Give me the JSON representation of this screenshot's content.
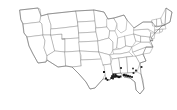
{
  "figure": {
    "kind": "choropleth-point-map",
    "region": "United States (contiguous 48 states)",
    "title": "",
    "subtitle": "",
    "background_color": "#ffffff",
    "state_fill_color": "#ffffff",
    "state_border_color": "#8a8a8a",
    "outline_color": "#6e6e6e",
    "marker_color": "#1a1a1a",
    "legend": "",
    "annotations": []
  },
  "chart_data": {
    "type": "scatter",
    "title": "",
    "xlabel": "",
    "ylabel": "",
    "projection": "albers-usa",
    "xlim": [
      0,
      177
    ],
    "ylim": [
      0,
      110
    ],
    "grid": false,
    "legend_position": "none",
    "marker_shape": "square",
    "marker_color": "#1a1a1a",
    "series": [
      {
        "name": "Observation sites",
        "point_count": 23,
        "points": [
          {
            "x": 104.0,
            "y": 72.0,
            "size": 2.0,
            "region": "Arkansas-Louisiana border"
          },
          {
            "x": 106.0,
            "y": 78.5,
            "size": 2.0,
            "region": "Louisiana west"
          },
          {
            "x": 107.5,
            "y": 80.0,
            "size": 1.8,
            "region": "Louisiana southwest coast"
          },
          {
            "x": 112.5,
            "y": 76.5,
            "size": 2.6,
            "region": "Louisiana central"
          },
          {
            "x": 114.5,
            "y": 76.5,
            "size": 2.6,
            "region": "Louisiana east"
          },
          {
            "x": 116.0,
            "y": 76.0,
            "size": 2.4,
            "region": "Mississippi southwest"
          },
          {
            "x": 117.5,
            "y": 76.5,
            "size": 2.2,
            "region": "Mississippi south"
          },
          {
            "x": 119.0,
            "y": 77.0,
            "size": 2.2,
            "region": "Mississippi gulf"
          },
          {
            "x": 120.5,
            "y": 76.5,
            "size": 2.0,
            "region": "Mississippi coast"
          },
          {
            "x": 113.5,
            "y": 74.5,
            "size": 2.0,
            "region": "Louisiana north"
          },
          {
            "x": 115.5,
            "y": 74.5,
            "size": 1.8,
            "region": "Mississippi interior"
          },
          {
            "x": 111.5,
            "y": 78.0,
            "size": 2.0,
            "region": "Louisiana delta"
          },
          {
            "x": 113.0,
            "y": 78.5,
            "size": 1.8,
            "region": "Louisiana southeast"
          },
          {
            "x": 124.0,
            "y": 75.0,
            "size": 2.2,
            "region": "Alabama south"
          },
          {
            "x": 126.0,
            "y": 75.5,
            "size": 2.4,
            "region": "Alabama gulf"
          },
          {
            "x": 128.0,
            "y": 76.0,
            "size": 2.2,
            "region": "Alabama-Florida line"
          },
          {
            "x": 130.0,
            "y": 76.5,
            "size": 2.0,
            "region": "Florida panhandle west"
          },
          {
            "x": 132.0,
            "y": 77.0,
            "size": 1.8,
            "region": "Florida panhandle"
          },
          {
            "x": 133.5,
            "y": 73.0,
            "size": 1.8,
            "region": "Georgia southwest"
          },
          {
            "x": 136.0,
            "y": 70.5,
            "size": 1.8,
            "region": "Georgia central"
          },
          {
            "x": 141.5,
            "y": 67.0,
            "size": 1.8,
            "region": "South Carolina"
          },
          {
            "x": 121.0,
            "y": 68.0,
            "size": 1.8,
            "region": "Mississippi north"
          },
          {
            "x": 133.0,
            "y": 68.5,
            "size": 1.6,
            "region": "Georgia north"
          }
        ]
      }
    ]
  }
}
